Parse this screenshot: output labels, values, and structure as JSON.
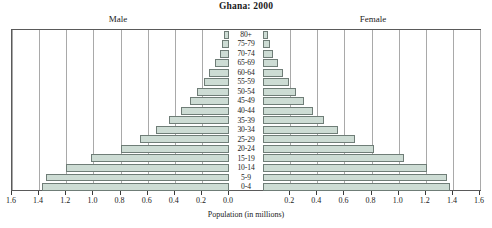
{
  "chart_data": {
    "type": "bar",
    "subtype": "population-pyramid",
    "title": "Ghana: 2000",
    "xlabel": "Population (in millions)",
    "ylabel": "",
    "xlim": [
      0,
      1.6
    ],
    "grid": true,
    "axis_ticks": [
      "1.6",
      "1.4",
      "1.2",
      "1.0",
      "0.8",
      "0.6",
      "0.4",
      "0.2",
      "0.0",
      "0.2",
      "0.4",
      "0.6",
      "0.8",
      "1.0",
      "1.2",
      "1.4",
      "1.6"
    ],
    "left_tick_labels": [
      "1.6",
      "1.4",
      "1.2",
      "1.0",
      "0.8",
      "0.6",
      "0.4",
      "0.2",
      "0.0"
    ],
    "right_tick_labels": [
      "0.0",
      "0.2",
      "0.4",
      "0.6",
      "0.8",
      "1.0",
      "1.2",
      "1.4",
      "1.6"
    ],
    "legend": [
      "Male",
      "Female"
    ],
    "legend_position": "top",
    "side_labels": {
      "left": "Male",
      "right": "Female"
    },
    "categories": [
      "80+",
      "75-79",
      "70-74",
      "65-69",
      "60-64",
      "55-59",
      "50-54",
      "45-49",
      "40-44",
      "35-39",
      "30-34",
      "25-29",
      "20-24",
      "15-19",
      "10-14",
      "5-9",
      "0-4"
    ],
    "series": [
      {
        "name": "Male",
        "values": [
          0.035,
          0.05,
          0.07,
          0.105,
          0.145,
          0.185,
          0.235,
          0.29,
          0.355,
          0.44,
          0.54,
          0.66,
          0.8,
          1.02,
          1.2,
          1.35,
          1.38
        ]
      },
      {
        "name": "Female",
        "values": [
          0.04,
          0.055,
          0.075,
          0.11,
          0.15,
          0.195,
          0.245,
          0.3,
          0.365,
          0.45,
          0.555,
          0.675,
          0.82,
          1.04,
          1.21,
          1.355,
          1.38
        ]
      }
    ],
    "colors": {
      "bar_fill": "#cddcd4",
      "bar_border": "#6f7d77",
      "gridline": "#a9a9a9",
      "frame": "#5a5a5a",
      "text": "#1a1a1a"
    }
  }
}
